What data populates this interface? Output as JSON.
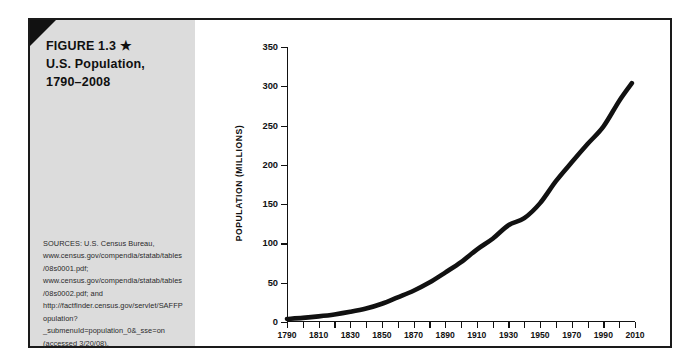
{
  "figure": {
    "title_lines": [
      "FIGURE 1.3 ★",
      "U.S. Population,",
      "1790–2008"
    ],
    "sources": "SOURCES: U.S. Census Bureau, www.census.gov/compendia/statab/tables/08s0001.pdf; www.census.gov/compendia/statab/tables/08s0002.pdf; and http://factfinder.census.gov/servlet/SAFFPopulation?_submenuId=population_0&_sse=on (accessed 3/20/08).",
    "panel_color": "#dcdcdc",
    "line_color": "#111111"
  },
  "chart_data": {
    "type": "line",
    "title": "U.S. Population, 1790–2008",
    "xlabel": "",
    "ylabel": "POPULATION (MILLIONS)",
    "xlim": [
      1790,
      2010
    ],
    "ylim": [
      0,
      350
    ],
    "grid": false,
    "legend": null,
    "y_ticks": [
      0,
      50,
      100,
      150,
      200,
      250,
      300,
      350
    ],
    "x_ticks": [
      1790,
      1800,
      1810,
      1820,
      1830,
      1840,
      1850,
      1860,
      1870,
      1880,
      1890,
      1900,
      1910,
      1920,
      1930,
      1940,
      1950,
      1960,
      1970,
      1980,
      1990,
      2000,
      2010
    ],
    "x_tick_labels": [
      1790,
      1810,
      1830,
      1850,
      1870,
      1890,
      1910,
      1930,
      1950,
      1970,
      1990,
      2010
    ],
    "x": [
      1790,
      1800,
      1810,
      1820,
      1830,
      1840,
      1850,
      1860,
      1870,
      1880,
      1890,
      1900,
      1910,
      1920,
      1930,
      1940,
      1950,
      1960,
      1970,
      1980,
      1990,
      2000,
      2008
    ],
    "values": [
      3.9,
      5.3,
      7.2,
      9.6,
      12.9,
      17.1,
      23.2,
      31.4,
      39.8,
      50.2,
      62.9,
      76.2,
      92.2,
      106.0,
      123.2,
      132.2,
      151.3,
      179.3,
      203.3,
      226.5,
      248.7,
      281.4,
      304.0
    ],
    "series_name": "U.S. Population (millions)"
  }
}
